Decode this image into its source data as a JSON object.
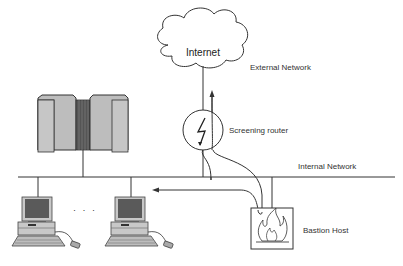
{
  "diagram": {
    "type": "network-topology",
    "nodes": {
      "internet": {
        "label": "Internet"
      },
      "external_network": {
        "label": "External Network"
      },
      "screening_router": {
        "label": "Screening router"
      },
      "internal_network": {
        "label": "Internal Network"
      },
      "bastion_host": {
        "label": "Bastion Host"
      },
      "workstations_ellipsis": {
        "label": "· · ·"
      }
    },
    "colors": {
      "line": "#333333",
      "server_fill": "#bdbdbd",
      "server_dark": "#555555",
      "screen_fill": "#5a5a5a",
      "computer_fill": "#c8c8c8"
    }
  }
}
